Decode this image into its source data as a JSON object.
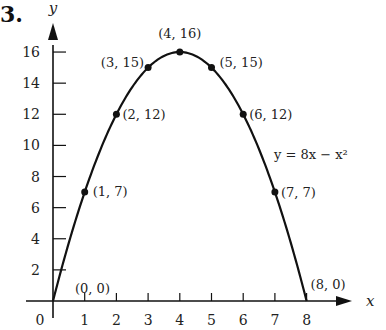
{
  "problem_number": "3.",
  "chart_data": {
    "type": "line",
    "title": "",
    "xlabel": "x",
    "ylabel": "y",
    "equation": "y = 8x − x²",
    "xlim": [
      0,
      8
    ],
    "ylim": [
      0,
      16
    ],
    "x_ticks": [
      1,
      2,
      3,
      4,
      5,
      6,
      7,
      8
    ],
    "y_ticks": [
      2,
      4,
      6,
      8,
      10,
      12,
      14,
      16
    ],
    "origin_label": "0",
    "series": [
      {
        "name": "y = 8x − x²",
        "x": [
          0,
          1,
          2,
          3,
          4,
          5,
          6,
          7,
          8
        ],
        "values": [
          0,
          7,
          12,
          15,
          16,
          15,
          12,
          7,
          0
        ]
      }
    ],
    "point_labels": [
      "(0, 0)",
      "(1, 7)",
      "(2, 12)",
      "(3, 15)",
      "(4, 16)",
      "(5, 15)",
      "(6, 12)",
      "(7, 7)",
      "(8, 0)"
    ],
    "grid": false
  }
}
